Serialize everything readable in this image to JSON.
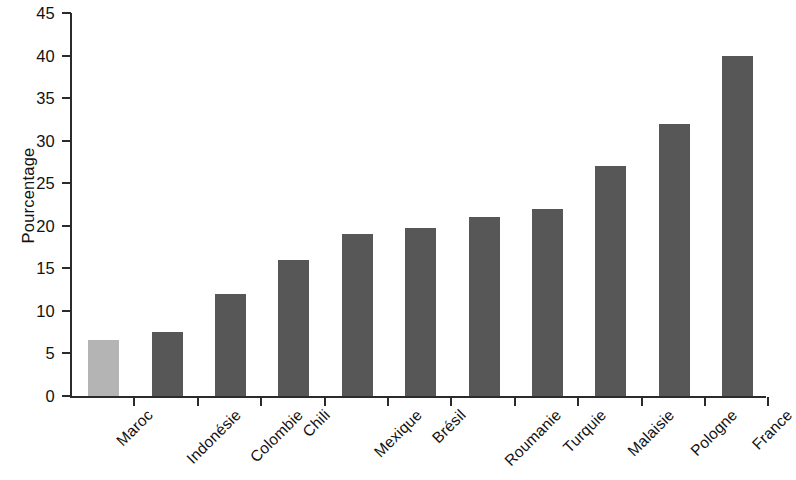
{
  "chart_data": {
    "type": "bar",
    "title": "",
    "subtitle": "",
    "xlabel": "",
    "ylabel": "Pourcentage",
    "ylim": [
      0,
      45
    ],
    "yticks": [
      0,
      5,
      10,
      15,
      20,
      25,
      30,
      35,
      40,
      45
    ],
    "grid": false,
    "legend": null,
    "legend_position": "none",
    "annotations": [],
    "categories": [
      "Maroc",
      "Indonésie",
      "Colombie",
      "Chili",
      "Mexique",
      "Brésil",
      "Roumanie",
      "Turquie",
      "Malaisie",
      "Pologne",
      "France"
    ],
    "values": [
      6.6,
      7.5,
      12.0,
      16.0,
      19.0,
      19.7,
      21.0,
      22.0,
      27.0,
      32.0,
      40.0
    ],
    "bar_colors": [
      "#b4b4b4",
      "#575757",
      "#575757",
      "#575757",
      "#575757",
      "#575757",
      "#575757",
      "#575757",
      "#575757",
      "#575757",
      "#575757"
    ],
    "highlight_category": "Maroc",
    "axis_color": "#2b2b2b",
    "background_color": "#ffffff"
  }
}
